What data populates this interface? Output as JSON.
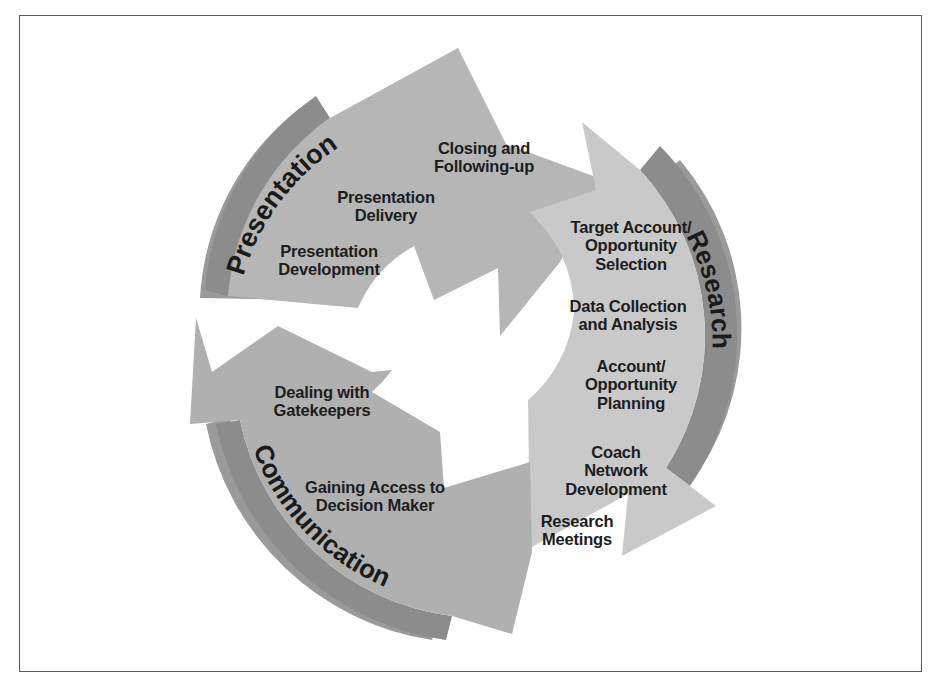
{
  "figure": {
    "type": "circular-pinwheel-cycle",
    "colors": {
      "background": "#ffffff",
      "frame_border": "#5a5a5a",
      "presentation_fill": "#b6b6b6",
      "communication_fill": "#b0b0b0",
      "research_fill": "#c9c9c9",
      "outer_band": "#8c8c8c",
      "shadow": "#9a9a9a",
      "text": "#1d1d1d"
    }
  },
  "segments": [
    {
      "id": "presentation",
      "label": "Presentation",
      "items": [
        {
          "text": "Closing and\nFollowing-up"
        },
        {
          "text": "Presentation\nDelivery"
        },
        {
          "text": "Presentation\nDevelopment"
        }
      ]
    },
    {
      "id": "research",
      "label": "Research",
      "items": [
        {
          "text": "Target Account/\nOpportunity\nSelection"
        },
        {
          "text": "Data Collection\nand Analysis"
        },
        {
          "text": "Account/\nOpportunity\nPlanning"
        },
        {
          "text": "Coach\nNetwork\nDevelopment"
        },
        {
          "text": "Research\nMeetings"
        }
      ]
    },
    {
      "id": "communication",
      "label": "Communication",
      "items": [
        {
          "text": "Dealing with\nGatekeepers"
        },
        {
          "text": "Gaining Access to\nDecision Maker"
        }
      ]
    }
  ]
}
